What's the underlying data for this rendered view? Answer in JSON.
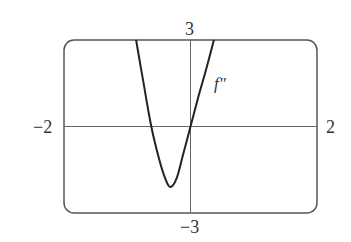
{
  "chart_data": {
    "type": "line",
    "title": "",
    "xlabel": "",
    "ylabel": "",
    "xlim": [
      -2,
      2
    ],
    "ylim": [
      -3,
      3
    ],
    "grid": false,
    "legend": null,
    "tick_labels": {
      "x_min": "−2",
      "x_max": "2",
      "y_max": "3",
      "y_min": "−3"
    },
    "annotations": [
      {
        "text": "f″",
        "x": 0.5,
        "y": 1.8
      }
    ],
    "series": [
      {
        "name": "f″",
        "x": [
          -0.86,
          -0.75,
          -0.62,
          -0.5,
          -0.4,
          -0.32,
          -0.22,
          -0.12,
          0.0,
          0.12,
          0.25,
          0.37
        ],
        "y": [
          3.0,
          1.6,
          0.0,
          -1.1,
          -1.8,
          -2.1,
          -1.8,
          -1.0,
          0.0,
          1.0,
          2.0,
          3.0
        ]
      }
    ]
  }
}
